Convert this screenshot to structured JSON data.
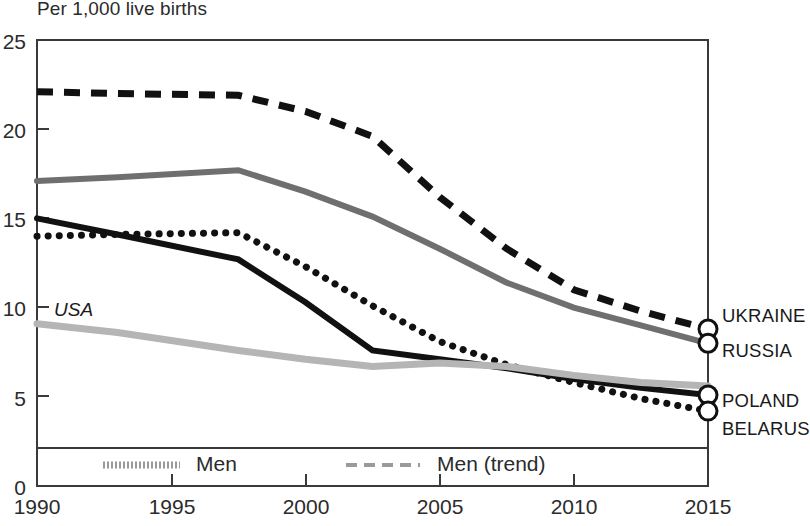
{
  "chart_data": {
    "type": "line",
    "title": "Per 1,000 live births",
    "xlabel": "",
    "ylabel": "Per 1,000 live births",
    "xlim": [
      1990,
      2015
    ],
    "ylim": [
      0,
      25
    ],
    "yticks": [
      0,
      5,
      10,
      15,
      20,
      25
    ],
    "xticks": [
      1990,
      1995,
      2000,
      2005,
      2010,
      2015
    ],
    "grid": false,
    "legend_position": "bottom",
    "annotations": [
      "USA"
    ],
    "series": [
      {
        "name": "UKRAINE",
        "style": "dashed",
        "color": "#111111",
        "end_marker": true,
        "x": [
          1990,
          1993,
          1997.5,
          2000,
          2002.5,
          2005,
          2007.5,
          2010,
          2012.5,
          2015
        ],
        "values": [
          22.1,
          22.0,
          21.9,
          21.0,
          19.6,
          16.2,
          13.3,
          11.0,
          9.8,
          8.8
        ]
      },
      {
        "name": "RUSSIA",
        "style": "solid",
        "color": "#6f6f6f",
        "end_marker": true,
        "x": [
          1990,
          1993,
          1997.5,
          2000,
          2002.5,
          2005,
          2007.5,
          2010,
          2012.5,
          2015
        ],
        "values": [
          17.1,
          17.3,
          17.7,
          16.5,
          15.1,
          13.3,
          11.4,
          10.0,
          9.0,
          8.0
        ]
      },
      {
        "name": "POLAND",
        "style": "solid",
        "color": "#111111",
        "end_marker": true,
        "x": [
          1990,
          1993,
          1997.5,
          2000,
          2002.5,
          2005,
          2007.5,
          2010,
          2012.5,
          2015
        ],
        "values": [
          15.0,
          14.1,
          12.7,
          10.3,
          7.6,
          7.1,
          6.6,
          6.0,
          5.5,
          5.1
        ]
      },
      {
        "name": "BELARUS",
        "style": "dotted",
        "color": "#111111",
        "end_marker": true,
        "x": [
          1990,
          1993,
          1997.5,
          2000,
          2002.5,
          2005,
          2007.5,
          2010,
          2012.5,
          2015
        ],
        "values": [
          14.0,
          14.1,
          14.2,
          12.3,
          10.1,
          8.1,
          6.8,
          5.8,
          4.9,
          4.2
        ]
      },
      {
        "name": "USA",
        "style": "solid",
        "color": "#b5b5b5",
        "end_marker": false,
        "x": [
          1990,
          1993,
          1997.5,
          2000,
          2002.5,
          2005,
          2007.5,
          2010,
          2012.5,
          2015
        ],
        "values": [
          9.1,
          8.6,
          7.6,
          7.1,
          6.7,
          6.9,
          6.7,
          6.2,
          5.8,
          5.6
        ]
      }
    ]
  },
  "axis": {
    "title": "Per 1,000 live births",
    "y_ticks": [
      "25",
      "20",
      "15",
      "10",
      "5",
      "0"
    ],
    "x_ticks": [
      "1990",
      "1995",
      "2000",
      "2005",
      "2010",
      "2015"
    ]
  },
  "series_labels": [
    {
      "text": "UKRAINE"
    },
    {
      "text": "RUSSIA"
    },
    {
      "text": "POLAND"
    },
    {
      "text": "BELARUS"
    }
  ],
  "annotations": {
    "usa": "USA"
  },
  "legend": {
    "items": [
      {
        "label": "Men",
        "style": "solid-gray"
      },
      {
        "label": "Men (trend)",
        "style": "dashed-gray"
      }
    ]
  },
  "colors": {
    "ukraine": "#111111",
    "russia": "#6f6f6f",
    "poland": "#111111",
    "belarus": "#111111",
    "usa": "#b5b5b5",
    "frame": "#3a3a3a",
    "text": "#2b2b2b"
  }
}
